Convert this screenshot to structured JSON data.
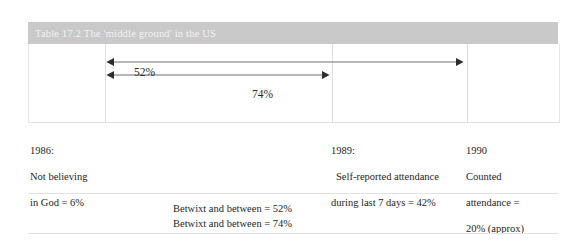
{
  "table": {
    "caption": "Table 17.2  The 'middle ground' in the US",
    "arrows": [
      {
        "label": "52%",
        "from": "1986",
        "to": "1990"
      },
      {
        "label": "74%",
        "from": "1986",
        "to": "1989"
      }
    ],
    "columns": [
      {
        "key": "col_1986",
        "year": "1986:",
        "line1": "Not believing",
        "line2": "in God = 6%"
      },
      {
        "key": "col_1989",
        "year": "1989:",
        "line1": "Self-reported attendance",
        "line2": "during last 7 days = 42%"
      },
      {
        "key": "col_1990",
        "year": "1990",
        "line1": "Counted",
        "line2": "attendance =",
        "line3": "20% (approx)"
      }
    ],
    "footer": [
      "Betwixt and between = 52%",
      "Betwixt and between = 74%"
    ],
    "colors": {
      "caption_bar": "#c9c9c9",
      "caption_text": "#f2f2f2",
      "rule": "#e3e3e3",
      "arrow": "#3a3a3a"
    }
  }
}
